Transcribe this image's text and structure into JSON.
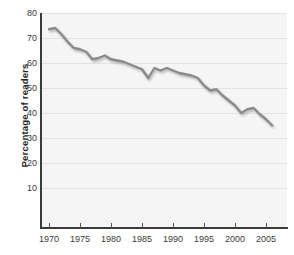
{
  "chart_data": {
    "type": "line",
    "title": "",
    "subtitle": "",
    "xlabel": "",
    "ylabel": "Percentage of readers",
    "xlim": [
      1970,
      2006
    ],
    "ylim": [
      0,
      80
    ],
    "grid": true,
    "legend_position": "none",
    "line_color": "#8a8a8a",
    "x_tick_labels": [
      "1970",
      "1975",
      "1980",
      "1985",
      "1990",
      "1995",
      "2000",
      "2005"
    ],
    "x_ticks": [
      1970,
      1975,
      1980,
      1985,
      1990,
      1995,
      2000,
      2005
    ],
    "y_tick_labels": [
      "80",
      "70",
      "60",
      "50",
      "40",
      "30",
      "20",
      "10"
    ],
    "y_ticks": [
      80,
      70,
      60,
      50,
      40,
      30,
      20,
      10
    ],
    "x": [
      1970,
      1971,
      1972,
      1973,
      1974,
      1975,
      1976,
      1977,
      1978,
      1979,
      1980,
      1981,
      1982,
      1983,
      1984,
      1985,
      1986,
      1987,
      1988,
      1989,
      1990,
      1991,
      1992,
      1993,
      1994,
      1995,
      1996,
      1997,
      1998,
      1999,
      2000,
      2001,
      2002,
      2003,
      2004,
      2005,
      2006
    ],
    "values": [
      73.5,
      74.0,
      71.5,
      68.5,
      66.0,
      65.5,
      64.5,
      61.5,
      62.0,
      63.0,
      61.5,
      61.0,
      60.5,
      59.5,
      58.5,
      57.5,
      54.0,
      58.0,
      57.0,
      58.0,
      57.0,
      56.0,
      55.5,
      55.0,
      54.0,
      51.0,
      49.0,
      49.5,
      47.0,
      45.0,
      43.0,
      40.0,
      41.5,
      42.0,
      39.5,
      37.5,
      35.0
    ],
    "series": [
      {
        "name": "Percentage of readers",
        "values": [
          73.5,
          74.0,
          71.5,
          68.5,
          66.0,
          65.5,
          64.5,
          61.5,
          62.0,
          63.0,
          61.5,
          61.0,
          60.5,
          59.5,
          58.5,
          57.5,
          54.0,
          58.0,
          57.0,
          58.0,
          57.0,
          56.0,
          55.5,
          55.0,
          54.0,
          51.0,
          49.0,
          49.5,
          47.0,
          45.0,
          43.0,
          40.0,
          41.5,
          42.0,
          39.5,
          37.5,
          35.0
        ]
      }
    ],
    "colors": {
      "line": "#8a8a8a",
      "line_shadow": "#b9b9b9",
      "plot_background": "#f5f5f5",
      "gridline": "#e3e3e3",
      "axis": "#3b3b3b",
      "tick_text": "#3a3a3a",
      "axis_title": "#222222"
    }
  }
}
